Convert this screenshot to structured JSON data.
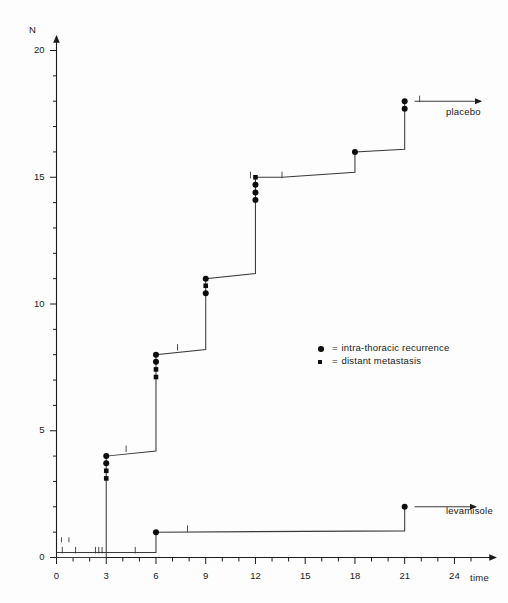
{
  "chart_data": {
    "type": "line",
    "title": "",
    "subtitle": "",
    "xlabel": "time",
    "ylabel": "N",
    "xlim": [
      0,
      26.5
    ],
    "ylim": [
      0,
      20.8
    ],
    "grid": false,
    "legend_position": "center-right",
    "x_ticks_major": [
      0,
      3,
      6,
      9,
      12,
      15,
      18,
      21,
      24
    ],
    "x_tick_labels": [
      "0",
      "3",
      "6",
      "9",
      "12",
      "15",
      "18",
      "21",
      "24"
    ],
    "x_tick_minor_step": 1,
    "y_ticks_major": [
      0,
      5,
      10,
      15,
      20
    ],
    "y_tick_labels": [
      "0",
      "5",
      "10",
      "15",
      "20"
    ],
    "y_tick_minor_step": 1,
    "legend": [
      {
        "marker": "circle",
        "equals": "=",
        "label": "intra-thoracic recurrence"
      },
      {
        "marker": "square",
        "equals": "=",
        "label": "distant metastasis"
      }
    ],
    "series": [
      {
        "name": "placebo",
        "label": "placebo",
        "label_x": 22.9,
        "label_y": 17.05,
        "arrow_from_x": 21.6,
        "arrow_to_x": 25.6,
        "arrow_y": 18.0,
        "steps": [
          {
            "x": 0.0,
            "y": 0.0
          },
          {
            "x": 3.0,
            "y": 0.0
          },
          {
            "x": 3.0,
            "y": 4.0
          },
          {
            "x": 6.0,
            "y": 4.2
          },
          {
            "x": 6.0,
            "y": 8.0
          },
          {
            "x": 9.0,
            "y": 8.2
          },
          {
            "x": 9.0,
            "y": 11.0
          },
          {
            "x": 12.0,
            "y": 11.2
          },
          {
            "x": 12.0,
            "y": 15.0
          },
          {
            "x": 13.6,
            "y": 15.0
          },
          {
            "x": 18.0,
            "y": 15.2
          },
          {
            "x": 18.0,
            "y": 16.0
          },
          {
            "x": 21.0,
            "y": 16.1
          },
          {
            "x": 21.0,
            "y": 18.0
          }
        ],
        "events": [
          {
            "x": 3.0,
            "y": 4.0,
            "marker": "circle"
          },
          {
            "x": 3.0,
            "y": 3.72,
            "marker": "circle"
          },
          {
            "x": 3.0,
            "y": 3.42,
            "marker": "square"
          },
          {
            "x": 3.0,
            "y": 3.12,
            "marker": "square"
          },
          {
            "x": 6.0,
            "y": 8.0,
            "marker": "circle"
          },
          {
            "x": 6.0,
            "y": 7.72,
            "marker": "circle"
          },
          {
            "x": 6.0,
            "y": 7.42,
            "marker": "square"
          },
          {
            "x": 6.0,
            "y": 7.12,
            "marker": "square"
          },
          {
            "x": 9.0,
            "y": 11.0,
            "marker": "circle"
          },
          {
            "x": 9.0,
            "y": 10.72,
            "marker": "square"
          },
          {
            "x": 9.0,
            "y": 10.42,
            "marker": "circle"
          },
          {
            "x": 12.0,
            "y": 15.0,
            "marker": "square"
          },
          {
            "x": 12.0,
            "y": 14.7,
            "marker": "circle"
          },
          {
            "x": 12.0,
            "y": 14.4,
            "marker": "circle"
          },
          {
            "x": 12.0,
            "y": 14.1,
            "marker": "circle"
          },
          {
            "x": 18.0,
            "y": 16.0,
            "marker": "circle"
          },
          {
            "x": 21.0,
            "y": 18.0,
            "marker": "circle"
          },
          {
            "x": 21.0,
            "y": 17.7,
            "marker": "circle"
          }
        ],
        "censor_ticks": [
          {
            "x": 4.2,
            "y": 4.2
          },
          {
            "x": 7.3,
            "y": 8.2
          },
          {
            "x": 11.7,
            "y": 15.0
          },
          {
            "x": 13.6,
            "y": 15.0
          },
          {
            "x": 21.9,
            "y": 18.0
          }
        ]
      },
      {
        "name": "levamisole",
        "label": "levamisole",
        "label_x": 23.2,
        "label_y": 0.75,
        "arrow_from_x": 21.6,
        "arrow_to_x": 25.3,
        "arrow_y": 2.0,
        "steps": [
          {
            "x": 0.0,
            "y": 0.2
          },
          {
            "x": 6.0,
            "y": 0.2
          },
          {
            "x": 6.0,
            "y": 1.0
          },
          {
            "x": 21.0,
            "y": 1.05
          },
          {
            "x": 21.0,
            "y": 2.0
          }
        ],
        "events": [
          {
            "x": 6.0,
            "y": 1.0,
            "marker": "circle"
          },
          {
            "x": 21.0,
            "y": 2.0,
            "marker": "circle"
          }
        ],
        "censor_ticks": [
          {
            "x": 0.35,
            "y": 0.2
          },
          {
            "x": 1.15,
            "y": 0.2
          },
          {
            "x": 2.35,
            "y": 0.2
          },
          {
            "x": 2.55,
            "y": 0.2
          },
          {
            "x": 2.75,
            "y": 0.2
          },
          {
            "x": 4.75,
            "y": 0.2
          },
          {
            "x": 7.9,
            "y": 1.05
          }
        ]
      }
    ],
    "upper_censor_row": [
      {
        "x": 0.3,
        "y": 0.62
      },
      {
        "x": 0.75,
        "y": 0.62
      }
    ]
  }
}
